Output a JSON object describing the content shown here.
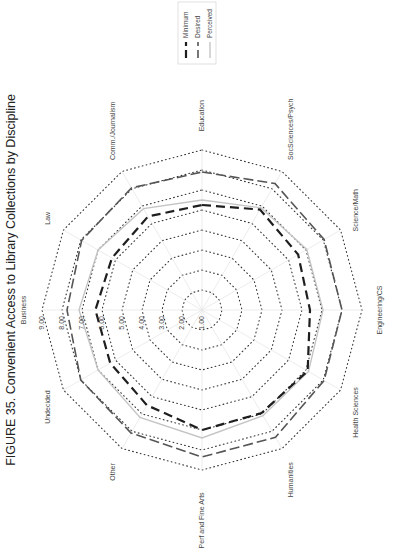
{
  "title": "FIGURE 35. Convenient Access to Library Collections by Discipline",
  "chart_data": {
    "type": "radar",
    "title": "FIGURE 35. Convenient Access to Library Collections by Discipline",
    "orientation_note": "figure rotated 90 degrees; title reads bottom-to-top along left edge",
    "axes": [
      "Education",
      "SocSciences/Psych",
      "Science/Math",
      "Engineering/CS",
      "Health Sciences",
      "Humanities",
      "Perf and Fine Arts",
      "Other",
      "Undecided",
      "Business",
      "Law",
      "Comm./Journalism"
    ],
    "tick_labels": [
      "1.00",
      "2.00",
      "3.00",
      "4.00",
      "5.00",
      "6.00",
      "7.00",
      "8.00",
      "9.00"
    ],
    "range": [
      1,
      9
    ],
    "grid": "dotted concentric polygons",
    "series": [
      {
        "name": "Minimum",
        "style": "thick dashed",
        "color": "#222222",
        "values": [
          6.25,
          6.8,
          6.55,
          6.4,
          7.1,
          6.95,
          7.0,
          6.5,
          6.3,
          6.33,
          6.2,
          6.4
        ]
      },
      {
        "name": "Desired",
        "style": "dashed",
        "color": "#555555",
        "values": [
          7.9,
          8.3,
          8.05,
          8.0,
          8.05,
          8.35,
          8.35,
          8.1,
          8.0,
          7.75,
          7.95,
          8.05
        ]
      },
      {
        "name": "Perceived",
        "style": "solid",
        "color": "#bbbbbb",
        "values": [
          6.5,
          6.9,
          7.05,
          7.05,
          7.15,
          7.1,
          7.4,
          7.2,
          7.0,
          7.15,
          7.0,
          6.85
        ]
      }
    ],
    "legend": {
      "position": "top-right",
      "entries": [
        "Minimum",
        "Desired",
        "Perceived"
      ]
    }
  },
  "legend": {
    "items": [
      "Minimum",
      "Desired",
      "Perceived"
    ]
  }
}
